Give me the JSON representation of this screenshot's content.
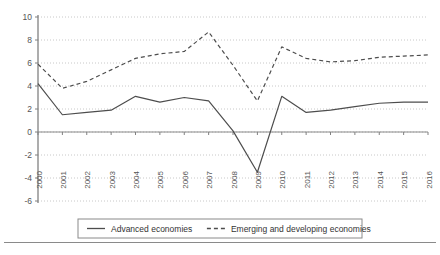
{
  "chart_data": {
    "type": "line",
    "title": "",
    "subtitle": "",
    "xlabel": "",
    "ylabel": "",
    "x": [
      "2000",
      "2001",
      "2002",
      "2003",
      "2004",
      "2005",
      "2006",
      "2007",
      "2008",
      "2009",
      "2010",
      "2011",
      "2012",
      "2013",
      "2014",
      "2015",
      "2016"
    ],
    "categories": [
      "2000",
      "2001",
      "2002",
      "2003",
      "2004",
      "2005",
      "2006",
      "2007",
      "2008",
      "2009",
      "2010",
      "2011",
      "2012",
      "2013",
      "2014",
      "2015",
      "2016"
    ],
    "series": [
      {
        "name": "Advanced economies",
        "style": "solid",
        "color": "#4d4d4d",
        "values": [
          4.2,
          1.5,
          1.7,
          1.9,
          3.1,
          2.6,
          3.0,
          2.7,
          0.1,
          -3.5,
          3.1,
          1.7,
          1.9,
          2.2,
          2.5,
          2.6,
          2.6
        ]
      },
      {
        "name": "Emerging and developing economies",
        "style": "dashed",
        "color": "#4d4d4d",
        "values": [
          5.9,
          3.8,
          4.4,
          5.4,
          6.4,
          6.8,
          7.0,
          8.7,
          5.8,
          2.7,
          7.4,
          6.4,
          6.1,
          6.2,
          6.5,
          6.6,
          6.7
        ]
      }
    ],
    "ylim": [
      -6,
      10
    ],
    "yticks": [
      -6,
      -4,
      -2,
      0,
      2,
      4,
      6,
      8,
      10
    ],
    "ytick_labels": [
      "-6",
      "-4",
      "-2",
      "0",
      "2",
      "4",
      "6",
      "8",
      "10"
    ],
    "grid": true,
    "grid_style": "dotted-horizontal",
    "legend_position": "bottom",
    "legend": [
      "Advanced economies",
      "Emerging and developing economies"
    ]
  },
  "axis": {
    "y_labels": [
      "10",
      "8",
      "6",
      "4",
      "2",
      "0",
      "-2",
      "-4",
      "-6"
    ],
    "x_labels": [
      "2000",
      "2001",
      "2002",
      "2003",
      "2004",
      "2005",
      "2006",
      "2007",
      "2008",
      "2009",
      "2010",
      "2011",
      "2012",
      "2013",
      "2014",
      "2015",
      "2016"
    ]
  },
  "legend": {
    "items": [
      {
        "label": "Advanced economies",
        "marker": "solid-line-swatch"
      },
      {
        "label": "Emerging and developing economies",
        "marker": "dashed-line-swatch"
      }
    ]
  },
  "colors": {
    "line": "#4d4d4d",
    "axis": "#808080",
    "grid": "#c8c8c8",
    "text": "#555555",
    "background": "#ffffff"
  }
}
